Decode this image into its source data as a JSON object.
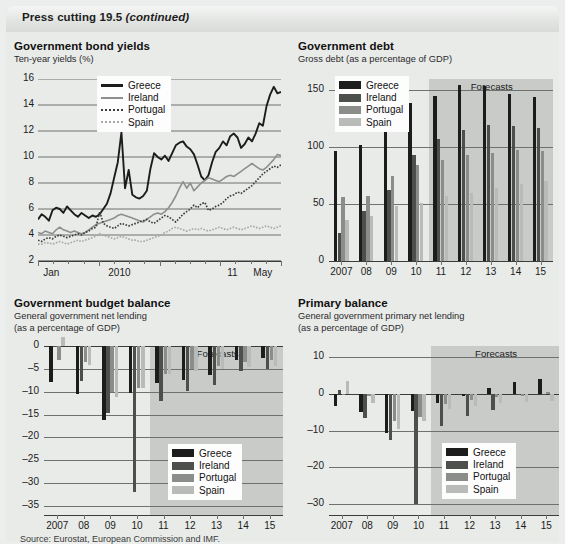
{
  "window": {
    "title_main": "Press cutting 19.5 ",
    "title_italic": "(continued)"
  },
  "colors": {
    "greece": "#1c1c1c",
    "ireland": "#4d4f4d",
    "portugal": "#8b8d8b",
    "spain": "#b9bbb9",
    "forecast_band": "#c9cbc9",
    "panel_bg": "#e9ebe9",
    "grid": "#6e716e"
  },
  "legend_labels": {
    "greece": "Greece",
    "ireland": "Ireland",
    "portugal": "Portugal",
    "spain": "Spain"
  },
  "forecast_label": "Forecasts",
  "source_note": "Source: Eurostat, European Commission and IMF.",
  "chart_data": [
    {
      "id": "bond_yields",
      "type": "line",
      "title": "Government bond yields",
      "subtitle": "Ten-year yields (%)",
      "ylabel": "",
      "xlabel": "",
      "ylim": [
        2,
        16
      ],
      "yticks": [
        2,
        4,
        6,
        8,
        10,
        12,
        14,
        16
      ],
      "xtick_labels": [
        "Jan",
        "2010",
        "11",
        "May"
      ],
      "xtick_positions": [
        0.055,
        0.335,
        0.8,
        0.925
      ],
      "grid": true,
      "legend_position": "top-center",
      "x_start": "Jan 2009",
      "x_end": "May 2011",
      "series": [
        {
          "name": "Greece",
          "style": "solid",
          "color": "#1c1c1c",
          "values": [
            5.2,
            5.6,
            5.4,
            5.1,
            5.9,
            6.1,
            6.0,
            5.7,
            6.2,
            5.9,
            5.6,
            5.4,
            5.7,
            5.5,
            5.3,
            5.5,
            5.4,
            5.6,
            6.0,
            6.4,
            7.2,
            8.4,
            9.6,
            11.9,
            7.6,
            9.0,
            7.1,
            6.9,
            6.8,
            7.0,
            7.4,
            9.1,
            10.3,
            10.0,
            9.8,
            10.1,
            9.7,
            10.3,
            10.9,
            11.1,
            11.2,
            10.8,
            10.6,
            10.2,
            9.4,
            8.5,
            8.2,
            8.6,
            9.6,
            10.4,
            10.7,
            11.2,
            10.9,
            11.6,
            11.8,
            11.5,
            10.7,
            11.0,
            11.5,
            11.2,
            11.8,
            12.6,
            12.4,
            13.9,
            14.8,
            15.4,
            14.9,
            15.0
          ]
        },
        {
          "name": "Ireland",
          "style": "solid",
          "color": "#8d8f8d",
          "values": [
            4.2,
            4.1,
            4.3,
            4.2,
            4.1,
            4.4,
            4.6,
            4.4,
            4.3,
            4.2,
            4.3,
            4.2,
            4.1,
            4.2,
            4.4,
            4.6,
            4.8,
            4.9,
            5.0,
            5.1,
            5.2,
            5.3,
            5.5,
            5.6,
            5.5,
            5.4,
            5.3,
            5.2,
            5.1,
            5.0,
            5.2,
            5.4,
            5.6,
            5.7,
            5.6,
            5.8,
            6.1,
            6.5,
            7.0,
            7.6,
            8.1,
            7.6,
            8.0,
            7.4,
            7.7,
            8.0,
            8.2,
            8.4,
            8.3,
            8.2,
            8.1,
            8.3,
            8.5,
            8.6,
            8.5,
            8.7,
            8.9,
            9.1,
            9.3,
            9.5,
            9.3,
            9.1,
            9.0,
            9.2,
            9.5,
            9.8,
            10.2,
            10.1
          ]
        },
        {
          "name": "Portugal",
          "style": "dotted",
          "color": "#3c3e3c",
          "values": [
            3.6,
            3.5,
            3.7,
            3.8,
            3.7,
            3.9,
            4.0,
            3.9,
            3.8,
            3.9,
            4.0,
            4.1,
            4.0,
            4.2,
            4.3,
            4.5,
            4.6,
            5.8,
            4.9,
            4.7,
            4.6,
            4.5,
            4.7,
            4.9,
            4.8,
            4.7,
            4.8,
            4.9,
            5.0,
            5.1,
            5.2,
            5.0,
            4.9,
            5.1,
            5.3,
            5.5,
            5.4,
            5.2,
            5.0,
            5.3,
            5.6,
            5.8,
            6.0,
            6.3,
            6.1,
            6.4,
            6.5,
            5.9,
            6.0,
            6.2,
            6.3,
            6.5,
            6.8,
            7.0,
            7.1,
            7.3,
            7.2,
            7.4,
            7.6,
            7.8,
            8.1,
            8.4,
            8.7,
            8.9,
            9.1,
            9.3,
            9.2,
            9.4
          ]
        },
        {
          "name": "Spain",
          "style": "dotted",
          "color": "#a7a9a7",
          "values": [
            3.3,
            3.3,
            3.4,
            3.4,
            3.3,
            3.4,
            3.5,
            3.4,
            3.3,
            3.4,
            3.5,
            3.6,
            3.5,
            3.6,
            3.7,
            3.8,
            3.9,
            4.1,
            4.0,
            3.9,
            3.8,
            3.7,
            3.8,
            3.9,
            3.8,
            3.7,
            3.6,
            3.6,
            3.5,
            3.5,
            3.6,
            3.7,
            3.8,
            3.9,
            4.0,
            4.2,
            4.3,
            4.5,
            4.6,
            4.5,
            4.4,
            4.3,
            4.4,
            4.5,
            4.4,
            4.5,
            4.4,
            4.3,
            4.4,
            4.5,
            4.6,
            4.5,
            4.4,
            4.5,
            4.6,
            4.5,
            4.4,
            4.5,
            4.6,
            4.7,
            4.6,
            4.5,
            4.6,
            4.7,
            4.6,
            4.5,
            4.6,
            4.7
          ]
        }
      ]
    },
    {
      "id": "government_debt",
      "type": "bar",
      "title": "Government debt",
      "subtitle": "Gross debt (as a percentage of GDP)",
      "categories": [
        "2007",
        "08",
        "09",
        "10",
        "11",
        "12",
        "13",
        "14",
        "15"
      ],
      "ylim": [
        0,
        160
      ],
      "yticks": [
        0,
        50,
        100,
        150
      ],
      "grid": true,
      "legend_position": "top-left",
      "forecast_from_index": 4,
      "series": [
        {
          "name": "Greece",
          "color": "#1c1c1c",
          "values": [
            97,
            102,
            117,
            139,
            145,
            155,
            154,
            147,
            144
          ]
        },
        {
          "name": "Ireland",
          "color": "#4d4f4d",
          "values": [
            25,
            44,
            62,
            93,
            107,
            115,
            120,
            119,
            117
          ]
        },
        {
          "name": "Portugal",
          "color": "#8b8d8b",
          "values": [
            56,
            57,
            75,
            84,
            89,
            93,
            95,
            98,
            97
          ]
        },
        {
          "name": "Spain",
          "color": "#b9bbb9",
          "values": [
            36,
            40,
            48,
            51,
            57,
            60,
            64,
            68,
            70
          ]
        }
      ]
    },
    {
      "id": "budget_balance",
      "type": "bar",
      "title": "Government budget balance",
      "subtitle": "General government net lending\n(as a percentage of GDP)",
      "subtitle_line1": "General government net lending",
      "subtitle_line2": "(as a percentage of GDP)",
      "categories": [
        "2007",
        "08",
        "09",
        "10",
        "11",
        "12",
        "13",
        "14",
        "15"
      ],
      "ylim": [
        -37,
        0
      ],
      "yticks": [
        0,
        -5,
        -10,
        -15,
        -20,
        -25,
        -30,
        -35
      ],
      "grid": true,
      "legend_position": "bottom-right",
      "forecast_from_index": 4,
      "series": [
        {
          "name": "Greece",
          "color": "#1c1c1c",
          "values": [
            -7.8,
            -10.5,
            -16.3,
            -10.2,
            -8.1,
            -7.5,
            -6.4,
            -3.0,
            -2.6
          ]
        },
        {
          "name": "Ireland",
          "color": "#4d4f4d",
          "values": [
            -0.2,
            -7.6,
            -14.6,
            -32.0,
            -12.1,
            -9.8,
            -8.5,
            -5.5,
            -5.0
          ]
        },
        {
          "name": "Portugal",
          "color": "#8b8d8b",
          "values": [
            -3.1,
            -3.6,
            -10.1,
            -9.2,
            -6.1,
            -5.1,
            -4.3,
            -3.4,
            -3.0
          ]
        },
        {
          "name": "Spain",
          "color": "#b9bbb9",
          "values": [
            1.9,
            -4.2,
            -11.2,
            -9.3,
            -6.2,
            -5.5,
            -5.0,
            -4.7,
            -4.4
          ]
        }
      ]
    },
    {
      "id": "primary_balance",
      "type": "bar",
      "title": "Primary balance",
      "subtitle_line1": "General government primary net lending",
      "subtitle_line2": "(as a percentage of GDP)",
      "categories": [
        "2007",
        "08",
        "09",
        "10",
        "11",
        "12",
        "13",
        "14",
        "15"
      ],
      "ylim": [
        -33,
        13
      ],
      "yticks": [
        10,
        0,
        -10,
        -20,
        -30
      ],
      "grid": true,
      "legend_position": "bottom-right",
      "forecast_from_index": 4,
      "series": [
        {
          "name": "Greece",
          "color": "#1c1c1c",
          "values": [
            -3.2,
            -5.1,
            -10.6,
            -4.8,
            -2.4,
            -0.7,
            1.5,
            3.3,
            4.0
          ]
        },
        {
          "name": "Ireland",
          "color": "#4d4f4d",
          "values": [
            0.9,
            -6.5,
            -12.6,
            -30.0,
            -8.9,
            -6.1,
            -4.3,
            -0.4,
            -0.2
          ]
        },
        {
          "name": "Portugal",
          "color": "#8b8d8b",
          "values": [
            -0.3,
            -0.7,
            -7.3,
            -6.3,
            -2.8,
            -1.6,
            -1.0,
            -0.6,
            0.4
          ]
        },
        {
          "name": "Spain",
          "color": "#b9bbb9",
          "values": [
            3.4,
            -2.6,
            -9.5,
            -7.5,
            -4.1,
            -3.2,
            -2.6,
            -2.2,
            -1.9
          ]
        }
      ]
    }
  ]
}
